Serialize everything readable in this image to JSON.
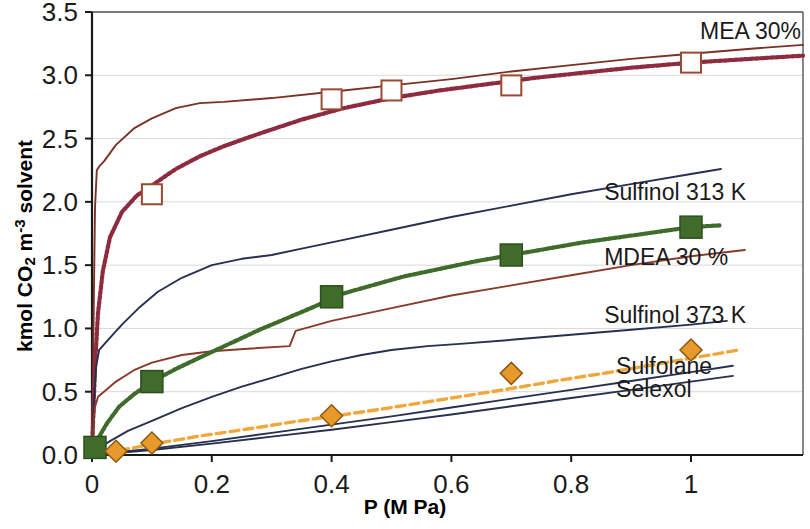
{
  "chart_data": {
    "type": "line",
    "title": "",
    "xlabel": "P (M Pa)",
    "ylabel_parts": {
      "pre": "kmol CO",
      "sub": "2",
      "mid": " m",
      "sup": "-3",
      "post": " solvent"
    },
    "ylabel": "kmol CO2 m-3 solvent",
    "xlim": [
      0,
      1.187
    ],
    "ylim": [
      0,
      3.5
    ],
    "xticks": [
      "0",
      "0.2",
      "0.4",
      "0.6",
      "0.8",
      "1"
    ],
    "xtick_values": [
      0,
      0.2,
      0.4,
      0.6,
      0.8,
      1
    ],
    "yticks": [
      "0.0",
      "0.5",
      "1.0",
      "1.5",
      "2.0",
      "2.5",
      "3.0",
      "3.5"
    ],
    "ytick_values": [
      0,
      0.5,
      1.0,
      1.5,
      2.0,
      2.5,
      3.0,
      3.5
    ],
    "grid": "horizontal",
    "legend_position": "right-inline-annotations",
    "colors": {
      "mea_solid": "#7a3226",
      "mea_dotted": "#8e2b3f",
      "mdea_dotted_green": "#3f6b2b",
      "mdea_solid_brown": "#8a3a2a",
      "sulfinol": "#26304f",
      "sulfolane": "#f0a83c",
      "marker_square_fill": "#3f6b2b",
      "marker_diamond_fill": "#e8992c",
      "grid": "#d9d9d9",
      "axis": "#1a1a1a"
    },
    "series": [
      {
        "name": "MEA 30%",
        "style": "solid",
        "color": "#7a3226",
        "label_x": 1.02,
        "label_y": 3.34,
        "points": [
          [
            0.0,
            0.0
          ],
          [
            0.0015,
            0.55
          ],
          [
            0.003,
            1.2
          ],
          [
            0.005,
            1.95
          ],
          [
            0.008,
            2.25
          ],
          [
            0.012,
            2.28
          ],
          [
            0.02,
            2.32
          ],
          [
            0.04,
            2.45
          ],
          [
            0.07,
            2.58
          ],
          [
            0.1,
            2.66
          ],
          [
            0.14,
            2.74
          ],
          [
            0.18,
            2.78
          ],
          [
            0.22,
            2.79
          ],
          [
            0.3,
            2.82
          ],
          [
            0.4,
            2.87
          ],
          [
            0.5,
            2.92
          ],
          [
            0.6,
            2.97
          ],
          [
            0.7,
            3.03
          ],
          [
            0.8,
            3.08
          ],
          [
            0.9,
            3.13
          ],
          [
            1.0,
            3.17
          ],
          [
            1.1,
            3.21
          ],
          [
            1.187,
            3.24
          ]
        ]
      },
      {
        "name": "MEA 30% (data fit)",
        "style": "dotted",
        "color": "#8e2b3f",
        "markers": "open-square",
        "points": [
          [
            0.0,
            0.0
          ],
          [
            0.002,
            0.3
          ],
          [
            0.005,
            0.7
          ],
          [
            0.01,
            1.12
          ],
          [
            0.018,
            1.45
          ],
          [
            0.03,
            1.72
          ],
          [
            0.05,
            1.92
          ],
          [
            0.075,
            2.05
          ],
          [
            0.1,
            2.13
          ],
          [
            0.14,
            2.26
          ],
          [
            0.18,
            2.36
          ],
          [
            0.22,
            2.44
          ],
          [
            0.28,
            2.54
          ],
          [
            0.35,
            2.65
          ],
          [
            0.42,
            2.74
          ],
          [
            0.5,
            2.82
          ],
          [
            0.58,
            2.88
          ],
          [
            0.66,
            2.93
          ],
          [
            0.74,
            2.98
          ],
          [
            0.82,
            3.02
          ],
          [
            0.9,
            3.06
          ],
          [
            1.0,
            3.1
          ],
          [
            1.1,
            3.13
          ],
          [
            1.187,
            3.155
          ]
        ],
        "marker_points": [
          [
            0.1,
            2.06
          ],
          [
            0.4,
            2.81
          ],
          [
            0.5,
            2.88
          ],
          [
            0.7,
            2.92
          ],
          [
            1.0,
            3.1
          ]
        ]
      },
      {
        "name": "Sulfinol 313 K",
        "style": "solid",
        "color": "#26304f",
        "label_x": 0.86,
        "label_y": 2.07,
        "points": [
          [
            0.0,
            0.0
          ],
          [
            0.003,
            0.4
          ],
          [
            0.007,
            0.7
          ],
          [
            0.012,
            0.83
          ],
          [
            0.025,
            0.9
          ],
          [
            0.05,
            1.03
          ],
          [
            0.08,
            1.17
          ],
          [
            0.11,
            1.29
          ],
          [
            0.15,
            1.4
          ],
          [
            0.2,
            1.5
          ],
          [
            0.25,
            1.55
          ],
          [
            0.3,
            1.58
          ],
          [
            0.35,
            1.63
          ],
          [
            0.42,
            1.7
          ],
          [
            0.5,
            1.78
          ],
          [
            0.6,
            1.88
          ],
          [
            0.7,
            1.97
          ],
          [
            0.8,
            2.06
          ],
          [
            0.9,
            2.14
          ],
          [
            1.0,
            2.22
          ],
          [
            1.05,
            2.26
          ]
        ]
      },
      {
        "name": "MDEA 30 %",
        "style": "solid",
        "color": "#8a3a2a",
        "label_x": 0.86,
        "label_y": 1.55,
        "points": [
          [
            0.0,
            0.0
          ],
          [
            0.002,
            0.2
          ],
          [
            0.005,
            0.38
          ],
          [
            0.01,
            0.46
          ],
          [
            0.02,
            0.5
          ],
          [
            0.04,
            0.58
          ],
          [
            0.07,
            0.67
          ],
          [
            0.1,
            0.73
          ],
          [
            0.15,
            0.79
          ],
          [
            0.2,
            0.82
          ],
          [
            0.26,
            0.84
          ],
          [
            0.33,
            0.86
          ],
          [
            0.34,
            0.98
          ],
          [
            0.4,
            1.06
          ],
          [
            0.5,
            1.16
          ],
          [
            0.6,
            1.26
          ],
          [
            0.7,
            1.34
          ],
          [
            0.8,
            1.42
          ],
          [
            0.9,
            1.5
          ],
          [
            1.0,
            1.57
          ],
          [
            1.09,
            1.62
          ]
        ]
      },
      {
        "name": "MDEA 30 % (data fit)",
        "style": "dotted",
        "color": "#3f6b2b",
        "markers": "filled-square",
        "points": [
          [
            0.0,
            0.06
          ],
          [
            0.01,
            0.13
          ],
          [
            0.025,
            0.25
          ],
          [
            0.045,
            0.38
          ],
          [
            0.07,
            0.48
          ],
          [
            0.1,
            0.58
          ],
          [
            0.14,
            0.68
          ],
          [
            0.18,
            0.77
          ],
          [
            0.23,
            0.88
          ],
          [
            0.28,
            0.99
          ],
          [
            0.33,
            1.09
          ],
          [
            0.38,
            1.19
          ],
          [
            0.4,
            1.25
          ],
          [
            0.46,
            1.33
          ],
          [
            0.52,
            1.41
          ],
          [
            0.58,
            1.47
          ],
          [
            0.64,
            1.53
          ],
          [
            0.7,
            1.58
          ],
          [
            0.76,
            1.63
          ],
          [
            0.82,
            1.68
          ],
          [
            0.88,
            1.72
          ],
          [
            0.94,
            1.76
          ],
          [
            1.0,
            1.8
          ],
          [
            1.05,
            1.815
          ]
        ],
        "marker_points": [
          [
            0.005,
            0.06
          ],
          [
            0.1,
            0.58
          ],
          [
            0.4,
            1.25
          ],
          [
            0.7,
            1.58
          ],
          [
            1.0,
            1.8
          ]
        ]
      },
      {
        "name": "Sulfinol 373 K",
        "style": "solid",
        "color": "#26304f",
        "label_x": 0.86,
        "label_y": 1.1,
        "points": [
          [
            0.0,
            0.0
          ],
          [
            0.01,
            0.05
          ],
          [
            0.03,
            0.11
          ],
          [
            0.06,
            0.19
          ],
          [
            0.1,
            0.27
          ],
          [
            0.15,
            0.37
          ],
          [
            0.2,
            0.46
          ],
          [
            0.25,
            0.54
          ],
          [
            0.3,
            0.61
          ],
          [
            0.35,
            0.68
          ],
          [
            0.4,
            0.74
          ],
          [
            0.45,
            0.79
          ],
          [
            0.5,
            0.83
          ],
          [
            0.56,
            0.86
          ],
          [
            0.62,
            0.88
          ],
          [
            0.7,
            0.91
          ],
          [
            0.8,
            0.95
          ],
          [
            0.9,
            0.99
          ],
          [
            1.0,
            1.03
          ],
          [
            1.06,
            1.06
          ]
        ]
      },
      {
        "name": "Sulfolane",
        "style": "dashed",
        "color": "#f0a83c",
        "markers": "filled-diamond",
        "label_x": 0.88,
        "label_y": 0.695,
        "points": [
          [
            0.0,
            0.0
          ],
          [
            0.04,
            0.03
          ],
          [
            0.1,
            0.085
          ],
          [
            0.18,
            0.15
          ],
          [
            0.26,
            0.205
          ],
          [
            0.34,
            0.265
          ],
          [
            0.4,
            0.305
          ],
          [
            0.48,
            0.36
          ],
          [
            0.56,
            0.42
          ],
          [
            0.64,
            0.48
          ],
          [
            0.7,
            0.525
          ],
          [
            0.78,
            0.59
          ],
          [
            0.86,
            0.65
          ],
          [
            0.94,
            0.715
          ],
          [
            1.0,
            0.765
          ],
          [
            1.05,
            0.805
          ],
          [
            1.08,
            0.83
          ]
        ],
        "marker_points": [
          [
            0.04,
            0.03
          ],
          [
            0.1,
            0.095
          ],
          [
            0.4,
            0.31
          ],
          [
            0.7,
            0.645
          ],
          [
            1.0,
            0.83
          ]
        ]
      },
      {
        "name": "Selexol",
        "style": "solid",
        "color": "#26304f",
        "label_x": 0.88,
        "label_y": 0.52,
        "points": [
          [
            0.0,
            0.0
          ],
          [
            0.1,
            0.05
          ],
          [
            0.2,
            0.11
          ],
          [
            0.3,
            0.175
          ],
          [
            0.4,
            0.24
          ],
          [
            0.5,
            0.305
          ],
          [
            0.6,
            0.375
          ],
          [
            0.7,
            0.445
          ],
          [
            0.8,
            0.515
          ],
          [
            0.9,
            0.585
          ],
          [
            1.0,
            0.655
          ],
          [
            1.07,
            0.705
          ]
        ]
      },
      {
        "name": "Selexol lower",
        "style": "solid",
        "color": "#26304f",
        "points": [
          [
            0.0,
            0.0
          ],
          [
            0.1,
            0.04
          ],
          [
            0.2,
            0.09
          ],
          [
            0.3,
            0.145
          ],
          [
            0.4,
            0.2
          ],
          [
            0.5,
            0.26
          ],
          [
            0.6,
            0.32
          ],
          [
            0.7,
            0.385
          ],
          [
            0.8,
            0.45
          ],
          [
            0.9,
            0.515
          ],
          [
            1.0,
            0.58
          ],
          [
            1.07,
            0.625
          ]
        ]
      }
    ],
    "annotations": [
      {
        "text": "MEA 30%",
        "x": 1.015,
        "y": 3.34
      },
      {
        "text": "Sulfinol 313 K",
        "x": 0.855,
        "y": 2.07
      },
      {
        "text": "MDEA 30 %",
        "x": 0.855,
        "y": 1.555
      },
      {
        "text": "Sulfinol 373 K",
        "x": 0.855,
        "y": 1.1
      },
      {
        "text": "Sulfolane",
        "x": 0.875,
        "y": 0.695
      },
      {
        "text": "Selexol",
        "x": 0.875,
        "y": 0.515
      }
    ]
  }
}
